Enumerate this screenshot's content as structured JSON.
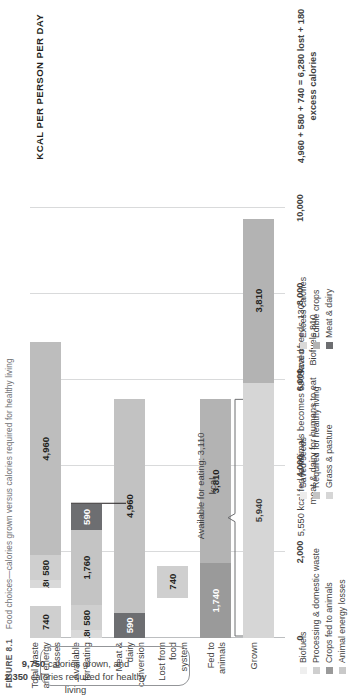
{
  "caption": {
    "label": "FIGURE 8.1",
    "text": "Food choices—calories grown versus calories required for healthy living"
  },
  "axis_title": "KCAL PER PERSON PER DAY",
  "callout": {
    "line1_value": "9,750",
    "line1_text": " calories grown, and",
    "line2_value": "2,350",
    "line2_text": " calories required for healthy living"
  },
  "annotations": {
    "conversion": "5,550 kcal fed\nto animals\nbecomes\n590 kcal of\nmeat & dairy\nfor humans to\neat",
    "saved_seeds": "Saved seeds 130",
    "biofuels": "Biofuels 810",
    "available_for_eating": "Available for\neating:\n3,110 kcal",
    "total_waste": "4,960 + 580 + 740\n= 6,280 lost +\n180 excess\ncalories"
  },
  "colors": {
    "edible_crops": "#b3b3b3",
    "grass_pasture": "#d6d6d6",
    "crops_fed_to_animals": "#9a9a9a",
    "animal_energy_losses": "#c9c9c9",
    "meat_dairy": "#6d6e71",
    "required_healthy": "#c4c4c4",
    "excess_calories": "#d9d9d9",
    "saved_seeds": "#ececec",
    "biofuels": "#efefef",
    "processing_waste": "#cfcfcf"
  },
  "legend": {
    "col1": [
      {
        "label": "Biofuels",
        "color": "#efefef"
      },
      {
        "label": "Processing & domestic waste",
        "color": "#cfcfcf"
      },
      {
        "label": "Crops fed to animals",
        "color": "#9a9a9a"
      },
      {
        "label": "Animal energy losses",
        "color": "#c9c9c9"
      }
    ],
    "col2": [
      {
        "label": "Saved seeds",
        "color": "#ececec"
      },
      {
        "label": "Required for healthy living",
        "color": "#c4c4c4"
      },
      {
        "label": "Grass & pasture",
        "color": "#d6d6d6"
      }
    ],
    "col3": [
      {
        "label": "Excess calories",
        "color": "#d9d9d9"
      },
      {
        "label": "Edible crops",
        "color": "#b3b3b3"
      },
      {
        "label": "Meat & dairy",
        "color": "#6d6e71"
      }
    ]
  },
  "chart_data": {
    "type": "bar",
    "orientation": "vertical-stacked",
    "title": "Food choices—calories grown versus calories required for healthy living",
    "xlabel": "",
    "ylabel": "KCAL PER PERSON PER DAY",
    "ylim": [
      0,
      10000
    ],
    "yticks": [
      "0",
      "2,000",
      "4,000",
      "6,000",
      "8,000",
      "10,000"
    ],
    "ytick_values": [
      0,
      2000,
      4000,
      6000,
      8000,
      10000
    ],
    "grid": true,
    "legend_position": "bottom",
    "categories": [
      "Grown",
      "Fed to animals",
      "Lost from food system",
      "Meat & dairy conversion",
      "Available for eating",
      "Total waste and energy losses"
    ],
    "bars": [
      {
        "category": "Grown",
        "total": 9750,
        "segments": [
          {
            "name": "Grass & pasture",
            "value": 5940,
            "label": "5,940",
            "color": "#d6d6d6",
            "text_color": "#3f3f41"
          },
          {
            "name": "Edible crops",
            "value": 3810,
            "label": "3,810",
            "color": "#b3b3b3",
            "text_color": "#231f20"
          }
        ]
      },
      {
        "category": "Fed to animals",
        "total": 5550,
        "segments": [
          {
            "name": "Animal energy losses",
            "value": 1740,
            "label": "1,740",
            "color": "#9a9a9a",
            "text_color": "#ffffff"
          },
          {
            "name": "Crops fed to animals",
            "value": 3810,
            "label": "3,810",
            "color": "#b3b3b3",
            "text_color": "#231f20"
          }
        ]
      },
      {
        "category": "Lost from food system",
        "total": 740,
        "segments": [
          {
            "name": "Processing & domestic waste",
            "value": 740,
            "label": "740",
            "color": "#cfcfcf",
            "text_color": "#231f20"
          }
        ],
        "extra_labels": [
          "Saved seeds 130",
          "Biofuels 810"
        ]
      },
      {
        "category": "Meat & dairy conversion",
        "total": 5550,
        "segments": [
          {
            "name": "Meat & dairy",
            "value": 590,
            "label": "590",
            "color": "#6d6e71",
            "text_color": "#ffffff"
          },
          {
            "name": "Crops fed to animals",
            "value": 4960,
            "label": "4,960",
            "color": "#c2c2c2",
            "text_color": "#231f20"
          }
        ]
      },
      {
        "category": "Available for eating",
        "total": 3110,
        "segments": [
          {
            "name": "Excess calories",
            "value": 180,
            "label": "180",
            "color": "#d9d9d9",
            "text_color": "#231f20"
          },
          {
            "name": "Processing & domestic waste",
            "value": 580,
            "label": "580",
            "color": "#cfcfcf",
            "text_color": "#231f20"
          },
          {
            "name": "Required for healthy living",
            "value": 1760,
            "label": "1,760",
            "color": "#c4c4c4",
            "text_color": "#231f20"
          },
          {
            "name": "Meat & dairy",
            "value": 590,
            "label": "590",
            "color": "#6d6e71",
            "text_color": "#ffffff"
          }
        ]
      },
      {
        "category": "Total waste and energy losses",
        "total": 6460,
        "segments": [
          {
            "name": "Processing & domestic waste",
            "value": 740,
            "label": "740",
            "color": "#cfcfcf",
            "text_color": "#231f20",
            "gap_before": true
          },
          {
            "name": "Excess calories",
            "value": 180,
            "label": "180",
            "color": "#d9d9d9",
            "text_color": "#231f20"
          },
          {
            "name": "Processing & domestic waste 2",
            "value": 580,
            "label": "580",
            "color": "#cfcfcf",
            "text_color": "#231f20"
          },
          {
            "name": "Animal energy losses",
            "value": 4960,
            "label": "4,960",
            "color": "#bdbdbd",
            "text_color": "#231f20"
          }
        ]
      }
    ]
  }
}
